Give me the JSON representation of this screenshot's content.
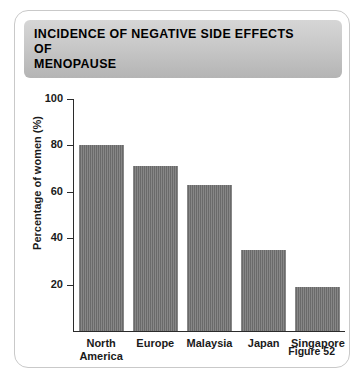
{
  "card": {
    "title": "INCIDENCE OF NEGATIVE SIDE EFFECTS OF\nMENOPAUSE",
    "caption": "Figure 52"
  },
  "colors": {
    "bar_fill": "#707070",
    "banner_top": "#d6d6d6",
    "banner_bottom": "#b4b4b4",
    "axis": "#2b2b2b",
    "card_border": "#c9c9c9"
  },
  "chart_data": {
    "type": "bar",
    "title": "INCIDENCE OF NEGATIVE SIDE EFFECTS OF MENOPAUSE",
    "xlabel": "",
    "ylabel": "Percentage of women (%)",
    "categories": [
      "North\nAmerica",
      "Europe",
      "Malaysia",
      "Japan",
      "Singapore"
    ],
    "values": [
      80,
      71,
      63,
      35,
      19
    ],
    "ylim": [
      0,
      100
    ],
    "yticks": [
      100,
      80,
      60,
      40,
      20
    ],
    "ytick_labels": [
      "100",
      "80",
      "60",
      "40",
      "20"
    ],
    "grid": false,
    "legend": null,
    "annotations": [
      "Figure 52"
    ]
  }
}
